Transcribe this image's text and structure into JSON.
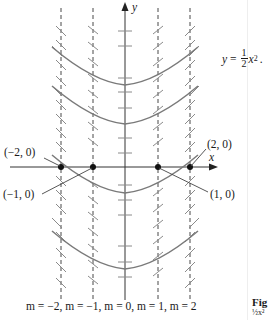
{
  "figure": {
    "equation": {
      "lhs": "y",
      "equals": "=",
      "coef_num": "1",
      "coef_den": "2",
      "var": "x",
      "exp": "2",
      "trailing": "."
    },
    "axes": {
      "x_label": "x",
      "y_label": "y"
    },
    "points": [
      {
        "label": "(−2, 0)"
      },
      {
        "label": "(−1, 0)"
      },
      {
        "label": "(1, 0)"
      },
      {
        "label": "(2, 0)"
      }
    ],
    "caption": "m = −2, m = −1, m = 0, m = 1, m = 2",
    "side_caption_title": "Fig",
    "side_caption_text": "½x²"
  },
  "colors": {
    "ink": "#1a1a1a",
    "curve": "#7a7a7a",
    "dash": "#333333",
    "slope": "#8a8a8a"
  }
}
